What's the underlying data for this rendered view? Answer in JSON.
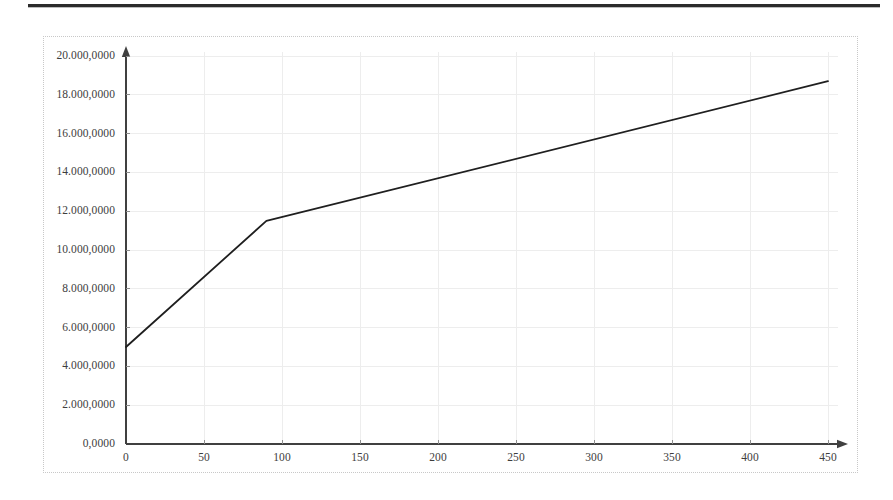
{
  "header": {
    "rule_color": "#2b2b2b"
  },
  "chart_data": {
    "type": "line",
    "title": "",
    "subtitle": "",
    "xlabel": "",
    "ylabel": "",
    "grid": true,
    "legend": null,
    "legend_position": "none",
    "series_color": "#1f1f1f",
    "axis_color": "#404040",
    "grid_color": "#ededed",
    "frame_color": "#c8c8c8",
    "xlim": [
      0,
      460
    ],
    "ylim": [
      0,
      20000
    ],
    "x_tick_labels": [
      "0",
      "50",
      "100",
      "150",
      "200",
      "250",
      "300",
      "350",
      "400",
      "450"
    ],
    "x_tick_values": [
      0,
      50,
      100,
      150,
      200,
      250,
      300,
      350,
      400,
      450
    ],
    "y_tick_labels": [
      "0,0000",
      "2.000,0000",
      "4.000,0000",
      "6.000,0000",
      "8.000,0000",
      "10.000,0000",
      "12.000,0000",
      "14.000,0000",
      "16.000,0000",
      "18.000,0000",
      "20.000,0000"
    ],
    "y_tick_values": [
      0,
      2000,
      4000,
      6000,
      8000,
      10000,
      12000,
      14000,
      16000,
      18000,
      20000
    ],
    "x_axis_arrow": true,
    "y_axis_arrow": true,
    "series": [
      {
        "name": "",
        "x": [
          0,
          90,
          450
        ],
        "values": [
          5000,
          11500,
          18700
        ],
        "points": [
          {
            "x": 0,
            "y": 5000
          },
          {
            "x": 90,
            "y": 11500
          },
          {
            "x": 450,
            "y": 18700
          }
        ]
      }
    ]
  }
}
